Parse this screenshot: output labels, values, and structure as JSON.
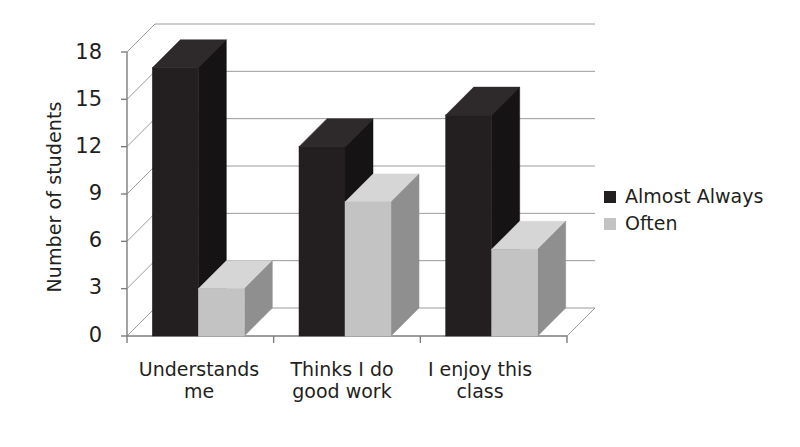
{
  "chart_data": {
    "type": "bar",
    "title": "",
    "subtitle": "",
    "xlabel": "",
    "ylabel": "Number of students",
    "categories": [
      "Understands me",
      "Thinks I do good work",
      "I enjoy this class"
    ],
    "category_lines": [
      [
        "Understands",
        "me"
      ],
      [
        "Thinks I do",
        "good work"
      ],
      [
        "I enjoy this",
        "class"
      ]
    ],
    "series": [
      {
        "name": "Almost Always",
        "color": "#231f20",
        "values": [
          17,
          12,
          14
        ]
      },
      {
        "name": "Often",
        "color": "#c3c3c3",
        "values": [
          3,
          8.5,
          5.5
        ]
      }
    ],
    "ylim": [
      0,
      18
    ],
    "yticks": [
      0,
      3,
      6,
      9,
      12,
      15,
      18
    ],
    "ytick_labels": [
      "0",
      "3",
      "6",
      "9",
      "12",
      "15",
      "18"
    ],
    "grid": true,
    "legend_position": "right",
    "style": "3d-clustered-column"
  },
  "legend": {
    "items": [
      {
        "label": "Almost Always",
        "swatch": "#231f20"
      },
      {
        "label": "Often",
        "swatch": "#c3c3c3"
      }
    ]
  },
  "axis": {
    "y_title": "Number of students",
    "tick_0": "0",
    "tick_3": "3",
    "tick_6": "6",
    "tick_9": "9",
    "tick_12": "12",
    "tick_15": "15",
    "tick_18": "18"
  },
  "colors": {
    "series_dark": "#231f20",
    "series_light": "#c3c3c3",
    "side_dark": "#151314",
    "side_light": "#8f8f8f",
    "top_dark": "#2e2a2b",
    "top_light": "#d6d6d6",
    "grid": "#9a9a9a",
    "axis": "#7d7d7d",
    "text": "#231f20",
    "background": "#ffffff"
  }
}
